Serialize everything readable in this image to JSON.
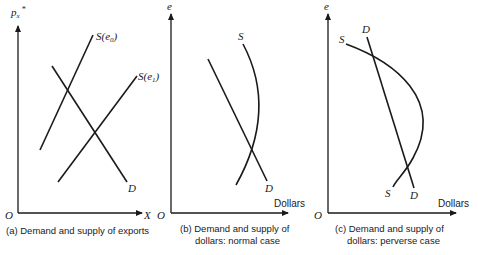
{
  "panels": [
    {
      "id": "a",
      "y_axis_label": "p",
      "y_axis_sub": "x",
      "y_axis_sup": "*",
      "x_axis_label": "X",
      "origin_label": "O",
      "curves": {
        "supply_e0": "S(e",
        "supply_e0_sub": "0",
        "supply_e1": "S(e",
        "supply_e1_sub": "1",
        "demand": "D"
      },
      "caption_line1": "(a) Demand and supply of exports"
    },
    {
      "id": "b",
      "y_axis_label": "e",
      "x_axis_label": "Dollars",
      "origin_label": "O",
      "curves": {
        "supply": "S",
        "demand": "D"
      },
      "caption_line1": "(b) Demand and supply of",
      "caption_line2": "dollars: normal case"
    },
    {
      "id": "c",
      "y_axis_label": "e",
      "x_axis_label": "Dollars",
      "origin_label": "O",
      "curves": {
        "supply_top": "S",
        "supply_bottom": "S",
        "demand_top": "D",
        "demand_bottom": "D"
      },
      "caption_line1": "(c) Demand and supply of",
      "caption_line2": "dollars: perverse case"
    }
  ]
}
